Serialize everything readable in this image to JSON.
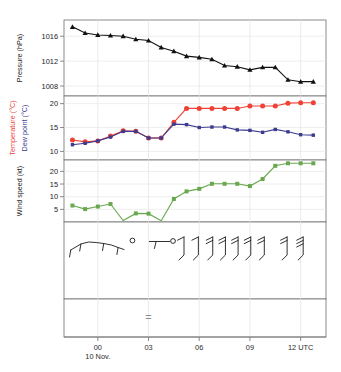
{
  "chart_data": {
    "type": "line",
    "title": "",
    "subtitle": "",
    "xlabel": "",
    "x_axis": {
      "tick_labels": [
        "00",
        "03",
        "06",
        "09",
        "12 UTC"
      ],
      "tick_hours": [
        0,
        3,
        6,
        9,
        12
      ],
      "date_label": "10 Nov.",
      "range_hours": [
        -2,
        13.5
      ],
      "units": "UTC"
    },
    "panels": [
      {
        "name": "pressure",
        "ylabel": "Pressure (hPa)",
        "units": "hPa",
        "ytick_labels": [
          "1016",
          "1012",
          "1008"
        ],
        "yticks": [
          1016,
          1012,
          1008
        ],
        "ylim": [
          1006.4,
          1018.6
        ],
        "color": "#111111",
        "marker": "triangle",
        "series": [
          {
            "name": "Pressure",
            "x": [
              -1.5,
              -0.75,
              0.0,
              0.75,
              1.5,
              2.25,
              3.0,
              3.75,
              4.5,
              5.25,
              6.0,
              6.75,
              7.5,
              8.25,
              9.0,
              9.75,
              10.5,
              11.25,
              12.0,
              12.75
            ],
            "values": [
              1017.5,
              1016.5,
              1016.2,
              1016.1,
              1016.0,
              1015.5,
              1015.3,
              1014.2,
              1013.6,
              1012.8,
              1012.6,
              1012.3,
              1011.3,
              1011.1,
              1010.6,
              1011.0,
              1011.0,
              1009.0,
              1008.7,
              1008.7
            ]
          }
        ]
      },
      {
        "name": "temperature_dewpoint",
        "ylabel_1": "Temperature (°C)",
        "ylabel_2": "Dew point (°C)",
        "units": "°C",
        "ytick_labels": [
          "20",
          "15",
          "10"
        ],
        "yticks": [
          20,
          15,
          10
        ],
        "ylim": [
          8.2,
          21.6
        ],
        "series": [
          {
            "name": "Temperature (°C)",
            "color": "#ef4136",
            "marker": "circle",
            "x": [
              -1.5,
              -0.75,
              0.0,
              0.75,
              1.5,
              2.25,
              3.0,
              3.75,
              4.5,
              5.25,
              6.0,
              6.75,
              7.5,
              8.25,
              9.0,
              9.75,
              10.5,
              11.25,
              12.0,
              12.75
            ],
            "values": [
              12.4,
              12.0,
              12.2,
              13.2,
              14.3,
              14.2,
              12.8,
              12.8,
              16.1,
              19.0,
              19.0,
              19.0,
              19.0,
              19.0,
              19.5,
              19.5,
              19.5,
              20.1,
              20.2,
              20.2
            ]
          },
          {
            "name": "Dew point (°C)",
            "color": "#3b3b8f",
            "marker": "square",
            "x": [
              -1.5,
              -0.75,
              0.0,
              0.75,
              1.5,
              2.25,
              3.0,
              3.75,
              4.5,
              5.25,
              6.0,
              6.75,
              7.5,
              8.25,
              9.0,
              9.75,
              10.5,
              11.25,
              12.0,
              12.75
            ],
            "values": [
              11.4,
              11.7,
              12.2,
              13.0,
              14.2,
              14.2,
              12.8,
              12.8,
              15.7,
              15.6,
              15.0,
              15.1,
              15.1,
              14.5,
              14.4,
              14.0,
              14.6,
              14.1,
              13.5,
              13.4
            ]
          }
        ]
      },
      {
        "name": "wind_speed",
        "ylabel": "Wind speed (kt)",
        "units": "kt",
        "ytick_labels": [
          "20",
          "15",
          "10",
          "5"
        ],
        "yticks": [
          20,
          15,
          10,
          5
        ],
        "ylim": [
          0,
          24.5
        ],
        "color": "#6aa84f",
        "marker": "square",
        "series": [
          {
            "name": "Wind speed",
            "x": [
              -1.5,
              -0.75,
              0.0,
              0.75,
              1.5,
              2.25,
              3.0,
              3.75,
              4.5,
              5.25,
              6.0,
              6.75,
              7.5,
              8.25,
              9.0,
              9.75,
              10.5,
              11.25,
              12.0,
              12.75
            ],
            "values": [
              6.5,
              5.1,
              6.1,
              7.1,
              0.6,
              3.4,
              3.3,
              0.5,
              9.1,
              12.1,
              13.1,
              15.1,
              15.1,
              15.1,
              14.2,
              17.0,
              22.2,
              23.2,
              23.2,
              23.2
            ]
          }
        ]
      },
      {
        "name": "present_weather_and_wind_barbs",
        "ylabel": "",
        "symbols_note": "station weather symbols and wind barbs",
        "wind_barbs": [
          {
            "hour": 4.5,
            "direction_deg": 200,
            "speed_kt": 10
          },
          {
            "hour": 5.25,
            "direction_deg": 200,
            "speed_kt": 10
          },
          {
            "hour": 6.0,
            "direction_deg": 205,
            "speed_kt": 15
          },
          {
            "hour": 6.75,
            "direction_deg": 205,
            "speed_kt": 15
          },
          {
            "hour": 7.5,
            "direction_deg": 205,
            "speed_kt": 15
          },
          {
            "hour": 8.25,
            "direction_deg": 205,
            "speed_kt": 15
          },
          {
            "hour": 9.0,
            "direction_deg": 205,
            "speed_kt": 15
          },
          {
            "hour": 10.5,
            "direction_deg": 210,
            "speed_kt": 20
          },
          {
            "hour": 11.5,
            "direction_deg": 210,
            "speed_kt": 25
          }
        ]
      },
      {
        "name": "present_weather_bottom",
        "ylabel": "",
        "symbols": [
          {
            "hour": 3.0,
            "glyph": "=",
            "meaning": "mist"
          }
        ]
      }
    ]
  },
  "labels": {
    "pressure": "Pressure (hPa)",
    "temperature": "Temperature (°C)",
    "dewpoint": "Dew point (°C)",
    "windspeed": "Wind speed (kt)",
    "date": "10 Nov.",
    "utc_suffix": "UTC"
  },
  "colors": {
    "pressure": "#111111",
    "temperature": "#ef4136",
    "dewpoint": "#3b3b8f",
    "windspeed": "#6aa84f",
    "axis": "#555555",
    "grid": "#e2e2e2",
    "background": "#ffffff"
  }
}
